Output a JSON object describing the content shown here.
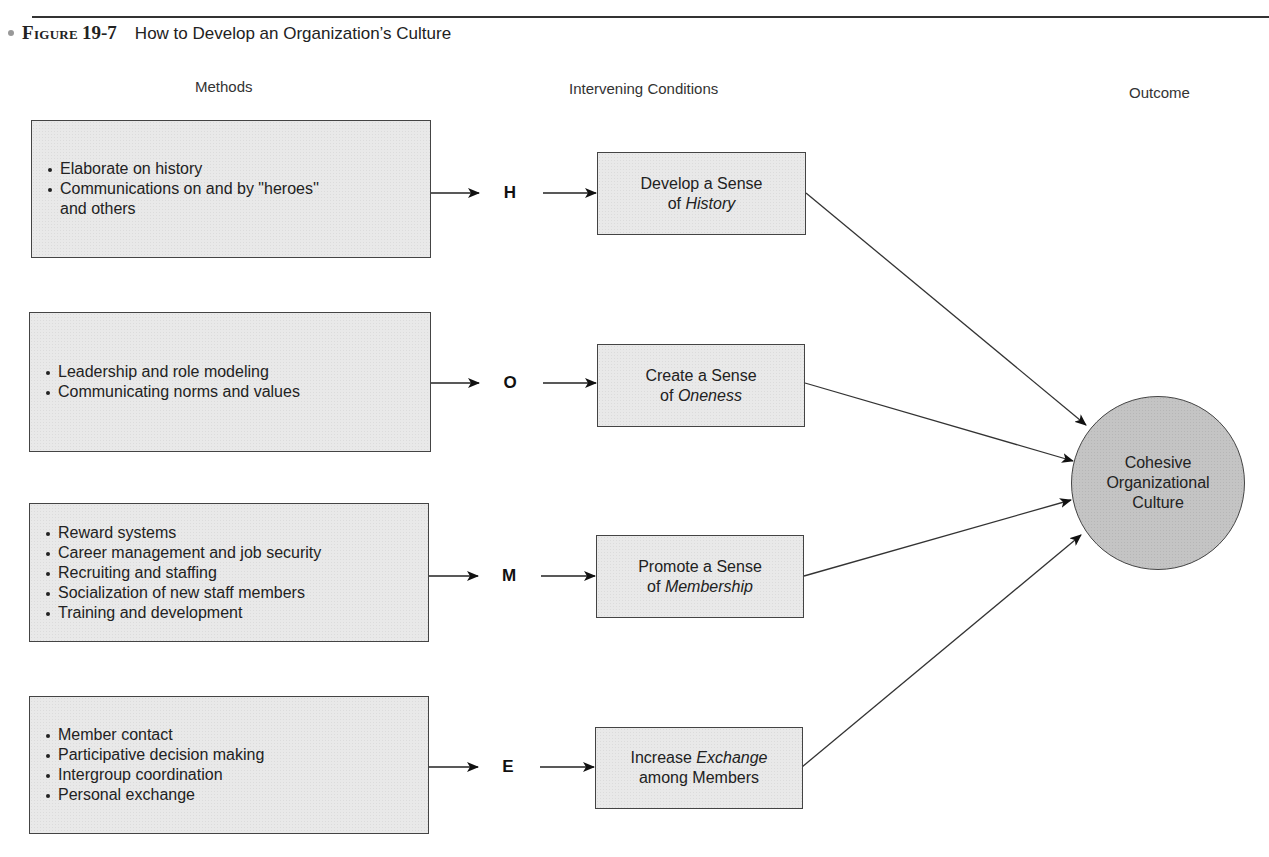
{
  "figure": {
    "label": "Figure",
    "number": "19-7",
    "caption": "How to Develop an Organization’s Culture"
  },
  "columns": {
    "methods": "Methods",
    "conditions": "Intervening Conditions",
    "outcome": "Outcome"
  },
  "rows": [
    {
      "letter": "H",
      "methods": [
        "Elaborate on history",
        "Communications on and by \"heroes''",
        "and others"
      ],
      "condition": {
        "line1": "Develop a Sense",
        "line2_prefix": "of ",
        "line2_em": "History",
        "line2_suffix": ""
      }
    },
    {
      "letter": "O",
      "methods": [
        "Leadership and role modeling",
        "Communicating norms and values"
      ],
      "condition": {
        "line1": "Create a Sense",
        "line2_prefix": "of ",
        "line2_em": "Oneness",
        "line2_suffix": ""
      }
    },
    {
      "letter": "M",
      "methods": [
        "Reward systems",
        "Career management and job security",
        "Recruiting and staffing",
        "Socialization of new staff members",
        "Training and development"
      ],
      "condition": {
        "line1": "Promote a Sense",
        "line2_prefix": "of ",
        "line2_em": "Membership",
        "line2_suffix": ""
      }
    },
    {
      "letter": "E",
      "methods": [
        "Member contact",
        "Participative decision making",
        "Intergroup coordination",
        "Personal exchange"
      ],
      "condition": {
        "line1_prefix": "Increase ",
        "line1_em": "Exchange",
        "line2": "among Members"
      }
    }
  ],
  "outcome": {
    "line1": "Cohesive",
    "line2": "Organizational",
    "line3": "Culture"
  },
  "colors": {
    "box_fill": "#e9e9e9",
    "circle_fill": "#c4c4c4",
    "stroke": "#444444"
  }
}
